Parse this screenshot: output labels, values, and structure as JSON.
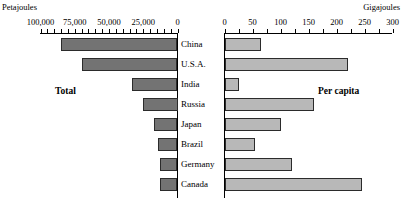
{
  "units": {
    "left": "Petajoules",
    "right": "Gigajoules"
  },
  "panels": {
    "left_caption": "Total",
    "right_caption": "Per capita"
  },
  "chart_data": {
    "type": "bar",
    "orientation": "horizontal",
    "title": "",
    "subtitle": "",
    "categories": [
      "China",
      "U.S.A.",
      "India",
      "Russia",
      "Japan",
      "Brazil",
      "Germany",
      "Canada"
    ],
    "series": [
      {
        "name": "Total",
        "unit": "Petajoules",
        "axis": "left",
        "direction": "right-to-left",
        "color": "#737373",
        "xlabel": "",
        "ylabel": "",
        "xlim": [
          0,
          100000
        ],
        "ticks": [
          100000,
          75000,
          50000,
          25000,
          0
        ],
        "tick_labels": [
          "100,000",
          "75,000",
          "50,000",
          "25,000",
          "0"
        ],
        "values": [
          85000,
          70000,
          33000,
          25000,
          17500,
          14000,
          13000,
          13000
        ]
      },
      {
        "name": "Per capita",
        "unit": "Gigajoules",
        "axis": "right",
        "direction": "left-to-right",
        "color": "#b8b8b8",
        "xlabel": "",
        "ylabel": "",
        "xlim": [
          0,
          300
        ],
        "ticks": [
          0,
          50,
          100,
          150,
          200,
          250,
          300
        ],
        "tick_labels": [
          "0",
          "50",
          "100",
          "150",
          "200",
          "250",
          "300"
        ],
        "values": [
          65,
          220,
          25,
          160,
          100,
          55,
          120,
          245
        ]
      }
    ],
    "grid": false,
    "legend": "none"
  }
}
